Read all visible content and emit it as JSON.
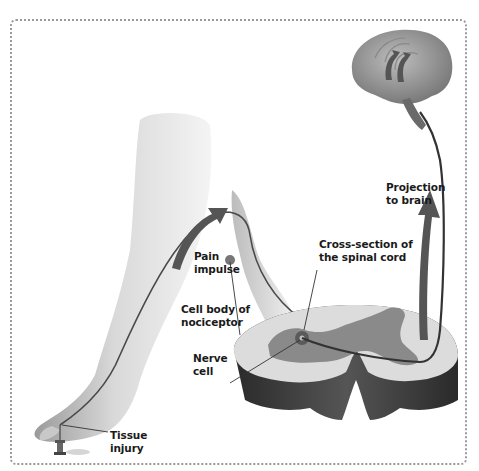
{
  "diagram": {
    "labels": {
      "pain_impulse": "Pain\nimpulse",
      "cell_body": "Cell body of\nnociceptor",
      "nerve_cell": "Nerve\ncell",
      "cross_section": "Cross-section of\nthe spinal cord",
      "projection": "Projection\nto brain",
      "tissue_injury": "Tissue\ninjury"
    },
    "structures": [
      "brain",
      "leg-and-foot",
      "spinal-cord-cross-section",
      "tack",
      "nociceptor-pathway"
    ],
    "colors": {
      "gray_matter": "#8a8a8a",
      "white_matter": "#d8d8d8",
      "cord_side": "#3a3a3a",
      "nerve_line": "#4a4a4a",
      "arrow": "#555555",
      "border": "#9a9a9a"
    }
  }
}
